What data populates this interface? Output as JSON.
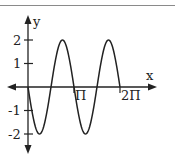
{
  "chart_data": {
    "type": "line",
    "title": "",
    "xlabel": "x",
    "ylabel": "y",
    "function": "y = -2 sin(2x)",
    "x_range": [
      0,
      6.2832
    ],
    "ylim": [
      -2,
      2
    ],
    "x_ticks": [
      {
        "value": 3.1416,
        "label": "Π"
      },
      {
        "value": 6.2832,
        "label": "2Π"
      }
    ],
    "y_ticks": [
      {
        "value": 2,
        "label": "2"
      },
      {
        "value": 1,
        "label": "1"
      },
      {
        "value": -1,
        "label": "-1"
      },
      {
        "value": -2,
        "label": "-2"
      }
    ],
    "series": [
      {
        "name": "curve",
        "x": [
          0,
          0.7854,
          1.5708,
          2.3562,
          3.1416,
          3.927,
          4.7124,
          5.4978,
          6.2832
        ],
        "values": [
          0,
          -2,
          0,
          2,
          0,
          -2,
          0,
          2,
          0
        ]
      }
    ],
    "grid": false,
    "legend": "none"
  },
  "labels": {
    "x_axis": "x",
    "y_axis": "y",
    "pi": "Π",
    "two_pi": "2Π",
    "y2": "2",
    "y1": "1",
    "yn1": "-1",
    "yn2": "-2"
  }
}
